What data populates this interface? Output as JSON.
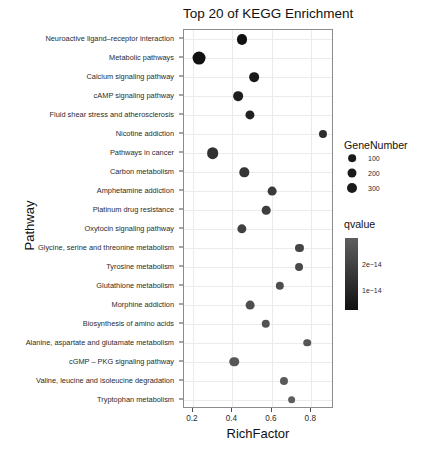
{
  "chart_data": {
    "type": "scatter",
    "title": "Top 20 of KEGG Enrichment",
    "xlabel": "RichFactor",
    "ylabel": "Pathway",
    "xlim": [
      0.155,
      0.915
    ],
    "xticks": [
      0.2,
      0.4,
      0.6,
      0.8
    ],
    "xticklabels": [
      "0.2",
      "0.4",
      "0.6",
      "0.8"
    ],
    "grid": true,
    "legend_position": "right",
    "categories": [
      "Neuroactive ligand–receptor interaction",
      "Metabolic pathways",
      "Calcium signaling pathway",
      "cAMP signaling pathway",
      "Fluid shear stress and atherosclerosis",
      "Nicotine addiction",
      "Pathways in cancer",
      "Carbon metabolism",
      "Amphetamine addiction",
      "Platinum drug resistance",
      "Oxytocin signaling pathway",
      "Glycine, serine and threonine metabolism",
      "Tyrosine metabolism",
      "Glutathione metabolism",
      "Morphine addiction",
      "Biosynthesis of amino acids",
      "Alanine, aspartate and glutamate metabolism",
      "cGMP – PKG signaling pathway",
      "Valine, leucine and isoleucine degradation",
      "Tryptophan metabolism"
    ],
    "points": [
      {
        "pathway": "Neuroactive ligand–receptor interaction",
        "richfactor": 0.45,
        "genenumber": 150,
        "qvalue": 1e-14
      },
      {
        "pathway": "Metabolic pathways",
        "richfactor": 0.23,
        "genenumber": 320,
        "qvalue": 1e-14
      },
      {
        "pathway": "Calcium signaling pathway",
        "richfactor": 0.51,
        "genenumber": 135,
        "qvalue": 1.2e-14
      },
      {
        "pathway": "cAMP signaling pathway",
        "richfactor": 0.43,
        "genenumber": 135,
        "qvalue": 1.3e-14
      },
      {
        "pathway": "Fluid shear stress and atherosclerosis",
        "richfactor": 0.49,
        "genenumber": 110,
        "qvalue": 1.4e-14
      },
      {
        "pathway": "Nicotine addiction",
        "richfactor": 0.86,
        "genenumber": 70,
        "qvalue": 1.7e-14
      },
      {
        "pathway": "Pathways in cancer",
        "richfactor": 0.3,
        "genenumber": 240,
        "qvalue": 1.8e-14
      },
      {
        "pathway": "Carbon metabolism",
        "richfactor": 0.46,
        "genenumber": 120,
        "qvalue": 1.9e-14
      },
      {
        "pathway": "Amphetamine addiction",
        "richfactor": 0.6,
        "genenumber": 95,
        "qvalue": 2e-14
      },
      {
        "pathway": "Platinum drug resistance",
        "richfactor": 0.57,
        "genenumber": 90,
        "qvalue": 2.1e-14
      },
      {
        "pathway": "Oxytocin signaling pathway",
        "richfactor": 0.45,
        "genenumber": 115,
        "qvalue": 2.2e-14
      },
      {
        "pathway": "Glycine, serine and threonine metabolism",
        "richfactor": 0.74,
        "genenumber": 70,
        "qvalue": 2.3e-14
      },
      {
        "pathway": "Tyrosine metabolism",
        "richfactor": 0.74,
        "genenumber": 65,
        "qvalue": 2.4e-14
      },
      {
        "pathway": "Glutathione metabolism",
        "richfactor": 0.64,
        "genenumber": 80,
        "qvalue": 2.5e-14
      },
      {
        "pathway": "Morphine addiction",
        "richfactor": 0.49,
        "genenumber": 95,
        "qvalue": 2.5e-14
      },
      {
        "pathway": "Biosynthesis of amino acids",
        "richfactor": 0.57,
        "genenumber": 85,
        "qvalue": 2.6e-14
      },
      {
        "pathway": "Alanine, aspartate and glutamate metabolism",
        "richfactor": 0.78,
        "genenumber": 55,
        "qvalue": 2.7e-14
      },
      {
        "pathway": "cGMP – PKG signaling pathway",
        "richfactor": 0.41,
        "genenumber": 125,
        "qvalue": 2.7e-14
      },
      {
        "pathway": "Valine, leucine and isoleucine degradation",
        "richfactor": 0.66,
        "genenumber": 70,
        "qvalue": 2.8e-14
      },
      {
        "pathway": "Tryptophan metabolism",
        "richfactor": 0.7,
        "genenumber": 60,
        "qvalue": 2.9e-14
      }
    ],
    "size_legend": {
      "title": "GeneNumber",
      "entries": [
        {
          "label": "100",
          "value": 100
        },
        {
          "label": "200",
          "value": 200
        },
        {
          "label": "300",
          "value": 300
        }
      ]
    },
    "color_legend": {
      "title": "qvalue",
      "ticks": [
        {
          "label": "2e−14",
          "value": 2e-14
        },
        {
          "label": "1e−14",
          "value": 1e-14
        }
      ],
      "high_color": "#5e5e5e",
      "low_color": "#111111"
    }
  }
}
